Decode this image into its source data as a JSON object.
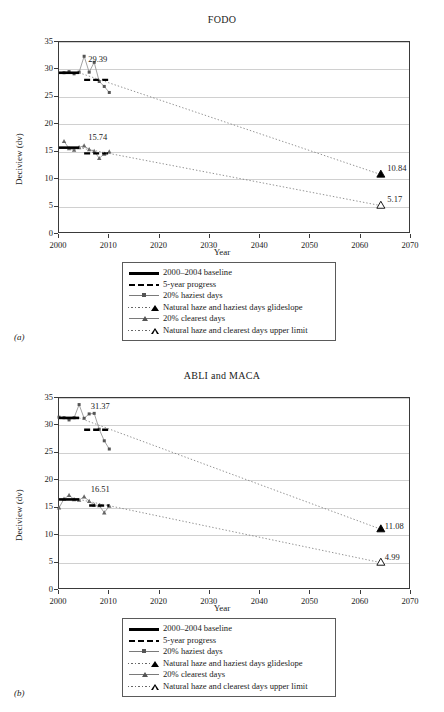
{
  "figure": {
    "panels": [
      {
        "tag": "(a)",
        "title": "FODO",
        "labels": {
          "haziest_baseline": "29.39",
          "clearest_baseline": "15.74",
          "haziest_endpoint": "10.84",
          "clearest_endpoint": "5.17"
        }
      },
      {
        "tag": "(b)",
        "title": "ABLI and MACA",
        "labels": {
          "haziest_baseline": "31.37",
          "clearest_baseline": "16.51",
          "haziest_endpoint": "11.08",
          "clearest_endpoint": "4.99"
        }
      }
    ],
    "axis": {
      "xlabel": "Year",
      "ylabel": "Deciview (dv)",
      "xticks": [
        "2000",
        "2010",
        "2020",
        "2030",
        "2040",
        "2050",
        "2060",
        "2070"
      ],
      "yticks": [
        "0",
        "5",
        "10",
        "15",
        "20",
        "25",
        "30",
        "35"
      ]
    },
    "legend": {
      "items": [
        {
          "key": "solid-line",
          "label": "2000–2004 baseline"
        },
        {
          "key": "dashed-line",
          "label": "5-year progress"
        },
        {
          "key": "line-square-marker",
          "label": "20% haziest days"
        },
        {
          "key": "dotted-filled-triangle",
          "label": "Natural haze and haziest days glideslope"
        },
        {
          "key": "line-triangle-marker",
          "label": "20% clearest days"
        },
        {
          "key": "dotted-open-triangle",
          "label": "Natural haze and clearest days upper limit"
        }
      ]
    }
  },
  "chart_data": [
    {
      "type": "line",
      "title": "FODO",
      "xlabel": "Year",
      "ylabel": "Deciview (dv)",
      "xlim": [
        2000,
        2070
      ],
      "ylim": [
        0,
        35
      ],
      "xticks": [
        2000,
        2010,
        2020,
        2030,
        2040,
        2050,
        2060,
        2070
      ],
      "yticks": [
        0,
        5,
        10,
        15,
        20,
        25,
        30,
        35
      ],
      "grid": "horizontal",
      "legend_position": "below-axes",
      "annotations": [
        {
          "text": "29.39",
          "x": 2006,
          "y": 31.6
        },
        {
          "text": "15.74",
          "x": 2006,
          "y": 17.4
        },
        {
          "text": "10.84",
          "x": 2065.5,
          "y": 11.6
        },
        {
          "text": "5.17",
          "x": 2065.5,
          "y": 6.0
        }
      ],
      "series": [
        {
          "name": "20% haziest days",
          "marker": "square",
          "x": [
            2001,
            2002,
            2003,
            2004,
            2005,
            2006,
            2007,
            2008,
            2009,
            2010
          ],
          "values": [
            29.4,
            29.6,
            29.2,
            29.5,
            32.4,
            29.5,
            31.3,
            27.8,
            26.9,
            25.8
          ]
        },
        {
          "name": "20% clearest days",
          "marker": "triangle",
          "x": [
            2001,
            2002,
            2003,
            2004,
            2005,
            2006,
            2007,
            2008,
            2009,
            2010
          ],
          "values": [
            16.9,
            15.6,
            15.3,
            15.8,
            16.1,
            15.4,
            15.1,
            13.8,
            14.6,
            15.0
          ]
        },
        {
          "name": "2000–2004 baseline (haziest)",
          "style": "solid",
          "x": [
            2000,
            2004
          ],
          "values": [
            29.39,
            29.39
          ]
        },
        {
          "name": "2000–2004 baseline (clearest)",
          "style": "solid",
          "x": [
            2000,
            2004
          ],
          "values": [
            15.74,
            15.74
          ]
        },
        {
          "name": "5-year progress (haziest)",
          "style": "dashed",
          "x": [
            2005,
            2010
          ],
          "values": [
            28.1,
            28.1
          ]
        },
        {
          "name": "5-year progress (clearest)",
          "style": "dashed",
          "x": [
            2005,
            2010
          ],
          "values": [
            14.7,
            14.7
          ]
        },
        {
          "name": "Natural haze and haziest days glideslope",
          "style": "dotted",
          "endpoint_marker": "filled-triangle",
          "x": [
            2004,
            2064
          ],
          "values": [
            29.39,
            10.84
          ]
        },
        {
          "name": "Natural haze and clearest days upper limit",
          "style": "dotted",
          "endpoint_marker": "open-triangle",
          "x": [
            2004,
            2064
          ],
          "values": [
            15.74,
            5.17
          ]
        }
      ]
    },
    {
      "type": "line",
      "title": "ABLI and MACA",
      "xlabel": "Year",
      "ylabel": "Deciview (dv)",
      "xlim": [
        2000,
        2070
      ],
      "ylim": [
        0,
        35
      ],
      "xticks": [
        2000,
        2010,
        2020,
        2030,
        2040,
        2050,
        2060,
        2070
      ],
      "yticks": [
        0,
        5,
        10,
        15,
        20,
        25,
        30,
        35
      ],
      "grid": "horizontal",
      "legend_position": "below-axes",
      "annotations": [
        {
          "text": "31.37",
          "x": 2006.5,
          "y": 33.2
        },
        {
          "text": "16.51",
          "x": 2006.5,
          "y": 18.0
        },
        {
          "text": "11.08",
          "x": 2065,
          "y": 11.3
        },
        {
          "text": "4.99",
          "x": 2065,
          "y": 5.6
        }
      ],
      "series": [
        {
          "name": "20% haziest days",
          "marker": "square",
          "x": [
            2000,
            2001,
            2002,
            2003,
            2004,
            2005,
            2006,
            2007,
            2008,
            2009,
            2010
          ],
          "values": [
            31.5,
            31.4,
            31.0,
            31.4,
            33.8,
            31.3,
            32.1,
            32.2,
            29.3,
            27.2,
            25.7
          ]
        },
        {
          "name": "20% clearest days",
          "marker": "triangle",
          "x": [
            2000,
            2001,
            2002,
            2003,
            2004,
            2005,
            2006,
            2007,
            2008,
            2009,
            2010
          ],
          "values": [
            15.0,
            16.6,
            17.3,
            16.5,
            16.4,
            17.0,
            16.2,
            15.5,
            15.4,
            14.1,
            15.3
          ]
        },
        {
          "name": "2000–2004 baseline (haziest)",
          "style": "solid",
          "x": [
            2000,
            2004
          ],
          "values": [
            31.37,
            31.37
          ]
        },
        {
          "name": "2000–2004 baseline (clearest)",
          "style": "solid",
          "x": [
            2000,
            2004
          ],
          "values": [
            16.51,
            16.51
          ]
        },
        {
          "name": "5-year progress (haziest)",
          "style": "dashed",
          "x": [
            2005,
            2010
          ],
          "values": [
            29.2,
            29.2
          ]
        },
        {
          "name": "5-year progress (clearest)",
          "style": "dashed",
          "x": [
            2006,
            2010
          ],
          "values": [
            15.4,
            15.4
          ]
        },
        {
          "name": "Natural haze and haziest days glideslope",
          "style": "dotted",
          "endpoint_marker": "filled-triangle",
          "x": [
            2004,
            2064
          ],
          "values": [
            31.37,
            11.08
          ]
        },
        {
          "name": "Natural haze and clearest days upper limit",
          "style": "dotted",
          "endpoint_marker": "open-triangle",
          "x": [
            2004,
            2064
          ],
          "values": [
            16.51,
            4.99
          ]
        }
      ]
    }
  ]
}
